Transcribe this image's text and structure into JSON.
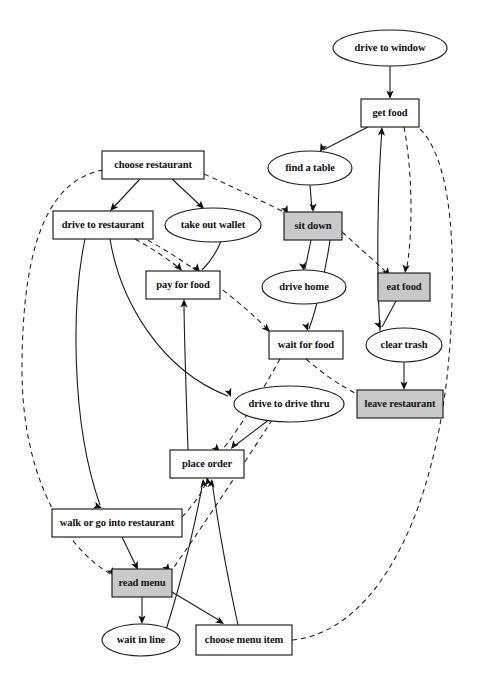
{
  "diagram": {
    "type": "directed-graph",
    "colors": {
      "node_fill_plain": "#ffffff",
      "node_fill_highlight": "#c9c9c9",
      "stroke": "#1a1a1a",
      "text": "#111111",
      "background": "#ffffff"
    },
    "nodes": [
      {
        "id": "drive_to_window",
        "label": "drive to window",
        "shape": "ellipse",
        "highlight": false,
        "cx": 390,
        "cy": 48,
        "rw": 57,
        "rh": 18
      },
      {
        "id": "get_food",
        "label": "get food",
        "shape": "box",
        "highlight": false,
        "cx": 390,
        "cy": 113,
        "rw": 29,
        "rh": 14
      },
      {
        "id": "find_a_table",
        "label": "find a table",
        "shape": "ellipse",
        "highlight": false,
        "cx": 310,
        "cy": 168,
        "rw": 42,
        "rh": 17
      },
      {
        "id": "choose_restaurant",
        "label": "choose restaurant",
        "shape": "box",
        "highlight": false,
        "cx": 153,
        "cy": 165,
        "rw": 51,
        "rh": 14
      },
      {
        "id": "drive_to_restaurant",
        "label": "drive to restaurant",
        "shape": "box",
        "highlight": false,
        "cx": 103,
        "cy": 225,
        "rw": 50,
        "rh": 14
      },
      {
        "id": "take_out_wallet",
        "label": "take out wallet",
        "shape": "ellipse",
        "highlight": false,
        "cx": 213,
        "cy": 225,
        "rw": 48,
        "rh": 17
      },
      {
        "id": "sit_down",
        "label": "sit down",
        "shape": "box",
        "highlight": true,
        "cx": 313,
        "cy": 226,
        "rw": 29,
        "rh": 14
      },
      {
        "id": "pay_for_food",
        "label": "pay for food",
        "shape": "box",
        "highlight": false,
        "cx": 183,
        "cy": 285,
        "rw": 37,
        "rh": 14
      },
      {
        "id": "drive_home",
        "label": "drive home",
        "shape": "ellipse",
        "highlight": false,
        "cx": 304,
        "cy": 287,
        "rw": 42,
        "rh": 17
      },
      {
        "id": "eat_food",
        "label": "eat food",
        "shape": "box",
        "highlight": true,
        "cx": 404,
        "cy": 287,
        "rw": 26,
        "rh": 14
      },
      {
        "id": "wait_for_food",
        "label": "wait for food",
        "shape": "box",
        "highlight": false,
        "cx": 306,
        "cy": 345,
        "rw": 37,
        "rh": 14
      },
      {
        "id": "clear_trash",
        "label": "clear trash",
        "shape": "ellipse",
        "highlight": false,
        "cx": 404,
        "cy": 345,
        "rw": 38,
        "rh": 17
      },
      {
        "id": "drive_to_drive_thru",
        "label": "drive to drive thru",
        "shape": "ellipse",
        "highlight": false,
        "cx": 289,
        "cy": 404,
        "rw": 55,
        "rh": 18
      },
      {
        "id": "leave_restaurant",
        "label": "leave restaurant",
        "shape": "box",
        "highlight": true,
        "cx": 400,
        "cy": 404,
        "rw": 43,
        "rh": 14
      },
      {
        "id": "place_order",
        "label": "place order",
        "shape": "box",
        "highlight": false,
        "cx": 207,
        "cy": 464,
        "rw": 37,
        "rh": 14
      },
      {
        "id": "walk_or_go_into",
        "label": "walk or go into restaurant",
        "shape": "box",
        "highlight": false,
        "cx": 117,
        "cy": 523,
        "rw": 65,
        "rh": 14
      },
      {
        "id": "read_menu",
        "label": "read menu",
        "shape": "box",
        "highlight": true,
        "cx": 142,
        "cy": 583,
        "rw": 30,
        "rh": 14
      },
      {
        "id": "wait_in_line",
        "label": "wait in line",
        "shape": "ellipse",
        "highlight": false,
        "cx": 141,
        "cy": 640,
        "rw": 39,
        "rh": 16
      },
      {
        "id": "choose_menu_item",
        "label": "choose menu item",
        "shape": "box",
        "highlight": false,
        "cx": 244,
        "cy": 640,
        "rw": 48,
        "rh": 15
      }
    ],
    "edges": [
      {
        "from": "drive_to_window",
        "to": "get_food",
        "style": "solid",
        "d": "M390,66 L390,97",
        "arrow": [
          390,
          99,
          0
        ]
      },
      {
        "from": "get_food",
        "to": "find_a_table",
        "style": "solid",
        "d": "M368,127 L323,150",
        "arrow": [
          320,
          152,
          27
        ]
      },
      {
        "from": "get_food",
        "to": "eat_food",
        "style": "dashed",
        "d": "M404,127 C414,180 412,245 406,271",
        "arrow": [
          405,
          273,
          8
        ]
      },
      {
        "from": "wait_for_food",
        "to": "get_food",
        "style": "solid",
        "d": "M380,331 C376,265 378,180 382,129",
        "arrow": [
          382,
          127,
          184
        ]
      },
      {
        "from": "find_a_table",
        "to": "sit_down",
        "style": "solid",
        "d": "M310,185 L312,210",
        "arrow": [
          313,
          212,
          0
        ]
      },
      {
        "from": "choose_restaurant",
        "to": "drive_to_restaurant",
        "style": "solid",
        "d": "M140,179 L112,209",
        "arrow": [
          110,
          211,
          42
        ]
      },
      {
        "from": "choose_restaurant",
        "to": "take_out_wallet",
        "style": "solid",
        "d": "M172,179 L202,207",
        "arrow": [
          204,
          209,
          -43
        ]
      },
      {
        "from": "choose_restaurant",
        "to": "sit_down",
        "style": "dashed",
        "d": "M204,174 C240,190 270,205 286,213",
        "arrow": [
          288,
          214,
          -27
        ]
      },
      {
        "from": "choose_restaurant",
        "to": "read_menu",
        "style": "dashed",
        "d": "M103,170 C50,180 22,240 22,370 C22,470 60,545 112,575",
        "arrow": [
          114,
          576,
          -30
        ]
      },
      {
        "from": "take_out_wallet",
        "to": "pay_for_food",
        "style": "solid",
        "d": "M221,241 C216,254 208,264 202,270",
        "arrow": [
          200,
          272,
          -40
        ]
      },
      {
        "from": "sit_down",
        "to": "drive_home",
        "style": "solid",
        "d": "M311,240 L305,269",
        "arrow": [
          304,
          271,
          -10
        ]
      },
      {
        "from": "sit_down",
        "to": "eat_food",
        "style": "dashed",
        "d": "M342,232 C362,250 380,266 388,274",
        "arrow": [
          390,
          276,
          -38
        ]
      },
      {
        "from": "sit_down",
        "to": "wait_for_food",
        "style": "solid",
        "d": "M330,240 C326,270 316,310 309,329",
        "arrow": [
          308,
          331,
          -18
        ]
      },
      {
        "from": "drive_to_restaurant",
        "to": "pay_for_food",
        "style": "dashed",
        "d": "M135,239 C155,250 172,262 180,269",
        "arrow": [
          182,
          271,
          -40
        ]
      },
      {
        "from": "drive_to_restaurant",
        "to": "wait_for_food",
        "style": "dashed",
        "d": "M140,236 C190,262 245,305 268,330",
        "arrow": [
          270,
          332,
          -45
        ]
      },
      {
        "from": "drive_to_restaurant",
        "to": "drive_to_drive_thru",
        "style": "solid",
        "d": "M110,239 C120,300 160,370 228,396",
        "arrow": [
          231,
          397,
          -22
        ]
      },
      {
        "from": "drive_to_restaurant",
        "to": "walk_or_go_into",
        "style": "solid",
        "d": "M85,239 C72,300 70,420 100,505",
        "arrow": [
          102,
          508,
          -70
        ]
      },
      {
        "from": "place_order",
        "to": "pay_for_food",
        "style": "solid",
        "d": "M188,450 C186,390 184,330 184,301",
        "arrow": [
          184,
          299,
          180
        ]
      },
      {
        "from": "wait_for_food",
        "to": "leave_restaurant",
        "style": "dashed",
        "d": "M306,359 C330,380 355,395 372,400",
        "arrow": [
          375,
          401,
          -72
        ]
      },
      {
        "from": "wait_for_food",
        "to": "place_order",
        "style": "dashed",
        "d": "M280,359 C260,395 235,435 222,450",
        "arrow": [
          220,
          452,
          -45
        ]
      },
      {
        "from": "eat_food",
        "to": "clear_trash",
        "style": "solid",
        "d": "M396,301 L382,327",
        "arrow": [
          381,
          329,
          -26
        ]
      },
      {
        "from": "clear_trash",
        "to": "leave_restaurant",
        "style": "solid",
        "d": "M404,362 L404,388",
        "arrow": [
          404,
          390,
          0
        ]
      },
      {
        "from": "drive_to_drive_thru",
        "to": "place_order",
        "style": "solid",
        "d": "M270,419 L233,447",
        "arrow": [
          231,
          449,
          38
        ]
      },
      {
        "from": "drive_to_drive_thru",
        "to": "read_menu",
        "style": "dashed",
        "d": "M272,420 C240,470 200,530 172,570",
        "arrow": [
          170,
          572,
          -35
        ]
      },
      {
        "from": "walk_or_go_into",
        "to": "read_menu",
        "style": "solid",
        "d": "M122,537 L137,568",
        "arrow": [
          138,
          570,
          -25
        ]
      },
      {
        "from": "walk_or_go_into",
        "to": "place_order",
        "style": "dashed",
        "d": "M182,517 C198,500 205,487 207,479",
        "arrow": [
          207,
          477,
          170
        ]
      },
      {
        "from": "read_menu",
        "to": "wait_in_line",
        "style": "solid",
        "d": "M142,597 L142,622",
        "arrow": [
          142,
          624,
          0
        ]
      },
      {
        "from": "read_menu",
        "to": "choose_menu_item",
        "style": "solid",
        "d": "M172,592 L222,622",
        "arrow": [
          224,
          624,
          -58
        ]
      },
      {
        "from": "choose_menu_item",
        "to": "place_order",
        "style": "solid",
        "d": "M238,625 C226,570 216,510 212,481",
        "arrow": [
          212,
          479,
          186
        ]
      },
      {
        "from": "wait_in_line",
        "to": "place_order",
        "style": "solid",
        "d": "M166,630 C185,570 198,510 203,481",
        "arrow": [
          203,
          479,
          174
        ]
      },
      {
        "from": "choose_menu_item",
        "to": "get_food",
        "style": "dashed",
        "d": "M292,640 C380,632 448,500 452,300 C456,170 430,128 406,120",
        "arrow": [
          404,
          119,
          255
        ]
      }
    ]
  }
}
